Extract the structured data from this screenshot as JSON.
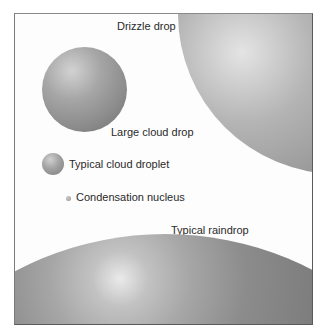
{
  "figure": {
    "labels": {
      "drizzle": "Drizzle drop",
      "large_cloud": "Large cloud drop",
      "typical_cloud": "Typical cloud droplet",
      "nucleus": "Condensation nucleus",
      "raindrop": "Typical raindrop"
    }
  },
  "colors": {
    "drop_light": "#e6e6e6",
    "drop_mid": "#a8a8a8",
    "drop_dark": "#6e6e6e",
    "frame": "#5a5a5a",
    "text": "#2a2a2a"
  }
}
